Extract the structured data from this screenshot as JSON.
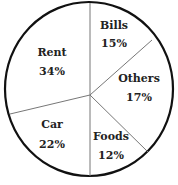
{
  "chart_data": {
    "type": "pie",
    "title": "",
    "categories": [
      "Bills",
      "Others",
      "Foods",
      "Car",
      "Rent"
    ],
    "values": [
      15,
      17,
      12,
      22,
      34
    ],
    "labels": [
      {
        "name": "Bills",
        "value": "15%",
        "x": 114,
        "y": 29,
        "vy": 47
      },
      {
        "name": "Others",
        "value": "17%",
        "x": 139,
        "y": 82,
        "vy": 101
      },
      {
        "name": "Foods",
        "value": "12%",
        "x": 111,
        "y": 140,
        "vy": 159
      },
      {
        "name": "Car",
        "value": "22%",
        "x": 52,
        "y": 128,
        "vy": 148
      },
      {
        "name": "Rent",
        "value": "34%",
        "x": 52,
        "y": 56,
        "vy": 75
      }
    ],
    "boundaries": [
      {
        "x1": 90,
        "y1": 95,
        "x2": 90,
        "y2": 3
      },
      {
        "x1": 90,
        "y1": 95,
        "x2": 152,
        "y2": 40
      },
      {
        "x1": 90,
        "y1": 95,
        "x2": 148,
        "y2": 152
      },
      {
        "x1": 90,
        "y1": 95,
        "x2": 90,
        "y2": 176
      },
      {
        "x1": 90,
        "y1": 95,
        "x2": 10,
        "y2": 114
      }
    ],
    "circle": {
      "cx": 89,
      "cy": 89,
      "rx": 84,
      "ry": 87
    },
    "colors": {
      "outline": "#111111",
      "divider": "#777777",
      "fill": "#ffffff"
    }
  }
}
